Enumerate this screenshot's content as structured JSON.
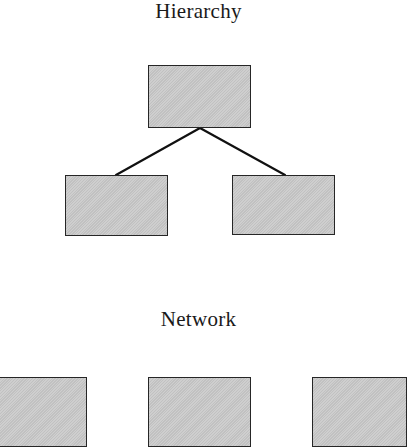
{
  "hierarchy": {
    "title": "Hierarchy",
    "nodes": [
      {
        "id": "root",
        "x": 148,
        "y": 65,
        "w": 103,
        "h": 63
      },
      {
        "id": "child-left",
        "x": 65,
        "y": 175,
        "w": 103,
        "h": 61
      },
      {
        "id": "child-right",
        "x": 232,
        "y": 175,
        "w": 103,
        "h": 60
      }
    ],
    "edges": [
      {
        "from": "root",
        "to": "child-left",
        "x1": 200,
        "y1": 128,
        "x2": 116,
        "y2": 175
      },
      {
        "from": "root",
        "to": "child-right",
        "x1": 200,
        "y1": 128,
        "x2": 285,
        "y2": 175
      }
    ]
  },
  "network": {
    "title": "Network",
    "nodes": [
      {
        "id": "net-left",
        "x": -4,
        "y": 377,
        "w": 91,
        "h": 70
      },
      {
        "id": "net-middle",
        "x": 148,
        "y": 377,
        "w": 103,
        "h": 70
      },
      {
        "id": "net-right",
        "x": 312,
        "y": 377,
        "w": 95,
        "h": 70
      }
    ]
  },
  "colors": {
    "node_fill": "#c9c9c9",
    "node_border": "#262626",
    "edge": "#111111",
    "text": "#1a1a1a",
    "background": "#ffffff"
  }
}
